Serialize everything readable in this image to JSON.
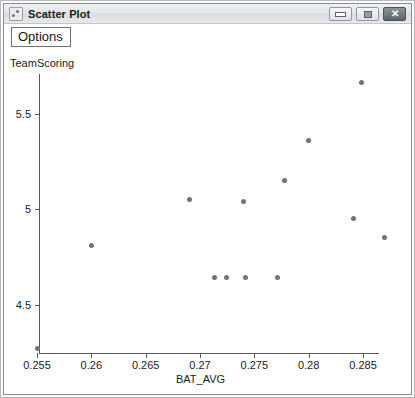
{
  "window": {
    "title": "Scatter Plot",
    "icon": "chart-icon",
    "buttons": [
      {
        "name": "minimize",
        "label": "–"
      },
      {
        "name": "maximize",
        "label": "□"
      },
      {
        "name": "close",
        "label": "✕"
      }
    ]
  },
  "toolbar": {
    "options_label": "Options"
  },
  "chart_data": {
    "type": "scatter",
    "title": "",
    "xlabel": "BAT_AVG",
    "ylabel": "TeamScoring",
    "xlim": [
      0.2535,
      0.2847
    ],
    "ylim": [
      4.27,
      5.72
    ],
    "xticks": [
      0.255,
      0.26,
      0.265,
      0.27,
      0.275,
      0.28,
      0.285
    ],
    "xtick_labels": [
      "0.255",
      "0.26",
      "0.265",
      "0.27",
      "0.275",
      "0.28",
      "0.285"
    ],
    "yticks": [
      4.5,
      5,
      5.5
    ],
    "ytick_labels": [
      "4.5",
      "5",
      "5.5"
    ],
    "grid": false,
    "legend": false,
    "marker_color": "#6f747a",
    "axis_color": "#555a5f",
    "points": [
      {
        "x": 0.255,
        "y": 4.27
      },
      {
        "x": 0.26,
        "y": 4.81
      },
      {
        "x": 0.269,
        "y": 5.05
      },
      {
        "x": 0.2713,
        "y": 4.64
      },
      {
        "x": 0.2724,
        "y": 4.64
      },
      {
        "x": 0.2742,
        "y": 4.64
      },
      {
        "x": 0.274,
        "y": 5.04
      },
      {
        "x": 0.2771,
        "y": 4.64
      },
      {
        "x": 0.2778,
        "y": 5.15
      },
      {
        "x": 0.28,
        "y": 5.36
      },
      {
        "x": 0.2841,
        "y": 4.95
      },
      {
        "x": 0.2849,
        "y": 5.66
      },
      {
        "x": 0.287,
        "y": 4.85
      }
    ]
  }
}
